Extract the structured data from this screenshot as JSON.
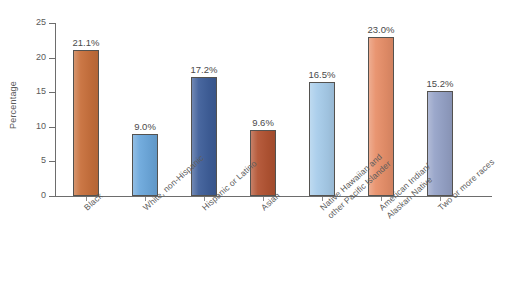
{
  "chart_data": {
    "type": "bar",
    "title": "",
    "xlabel": "",
    "ylabel": "Percentage",
    "ylim": [
      0,
      25
    ],
    "ytick_step": 5,
    "yticks": [
      "25",
      "20",
      "15",
      "10",
      "5",
      "0"
    ],
    "grid": false,
    "legend": "none",
    "categories": [
      "Black",
      "White, non-Hispanic",
      "Hispanic or Latino",
      "Asian",
      "Native Hawaiian and\nother Pacific Islander",
      "American Indian/\nAlaskan Native",
      "Two or more races"
    ],
    "values": [
      21.1,
      9.0,
      17.2,
      9.6,
      16.5,
      23.0,
      15.2
    ],
    "value_labels": [
      "21.1%",
      "9.0%",
      "17.2%",
      "9.6%",
      "16.5%",
      "23.0%",
      "15.2%"
    ],
    "bar_colors": [
      "#c8703c",
      "#6ca8dc",
      "#3f5f9a",
      "#b35433",
      "#a8cdeb",
      "#e8906a",
      "#96a3c8"
    ],
    "bar_edge_color": "#54524f",
    "axis_color": "#6d6d6d",
    "background_color": "#ffffff"
  }
}
